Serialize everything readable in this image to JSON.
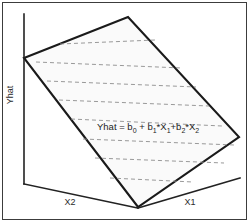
{
  "figure": {
    "background_color": "#ffffff",
    "frame": {
      "stroke_color": "#3c3c3c",
      "x": 2,
      "y": 2,
      "width": 245,
      "height": 218
    },
    "axes": {
      "vertical": {
        "label": "Yhat",
        "label_x": 13,
        "label_y": 95,
        "rotation": -90,
        "line": "M24,14 L24,184"
      },
      "left_horizontal": {
        "label": "X2",
        "label_x": 70,
        "label_y": 205,
        "line": "M24,184 L138,208"
      },
      "right_horizontal": {
        "label": "X1",
        "label_x": 190,
        "label_y": 205,
        "line": "M138,208 L240,178"
      },
      "stroke_color": "#222222"
    },
    "plane": {
      "fill_color": "#fafafa",
      "stroke_color": "#1a1a1a",
      "vertices": [
        {
          "name": "left",
          "x": 24,
          "y": 58
        },
        {
          "name": "top",
          "x": 128,
          "y": 17
        },
        {
          "name": "right",
          "x": 239,
          "y": 137
        },
        {
          "name": "bottom",
          "x": 138,
          "y": 207
        }
      ],
      "path": "M24,58 L128,17 L239,137 L138,207 Z"
    },
    "gridlines": {
      "stroke_color": "#8d8d8d",
      "dash_pattern": "4 3",
      "count": 8,
      "segments": [
        "M60,44 L155,40",
        "M36,62 L182,68",
        "M47,81 L196,87",
        "M59,100 L209,106",
        "M71,119 L222,126",
        "M83,139 L234,145",
        "M95,158 L224,163",
        "M110,178 L193,182"
      ]
    },
    "equation": {
      "full_text": "Yhat = b0 + b1*X1+b2*X2",
      "x": 97,
      "y": 130,
      "parts": [
        {
          "text": "Yhat = b",
          "sub": false
        },
        {
          "text": "0",
          "sub": true
        },
        {
          "text": " + b",
          "sub": false
        },
        {
          "text": "1",
          "sub": true
        },
        {
          "text": "*X",
          "sub": false
        },
        {
          "text": "1",
          "sub": true
        },
        {
          "text": "+b",
          "sub": false
        },
        {
          "text": "2",
          "sub": true
        },
        {
          "text": "*X",
          "sub": false
        },
        {
          "text": "2",
          "sub": true
        }
      ],
      "segment_labels": {
        "lead": "Yhat = b",
        "sub0": "0",
        "plus_b1": " + b",
        "sub1": "1",
        "times_x1": "*X",
        "sub1b": "1",
        "plus_b2": "+b",
        "sub2": "2",
        "times_x2": "*X",
        "sub2b": "2"
      }
    }
  }
}
